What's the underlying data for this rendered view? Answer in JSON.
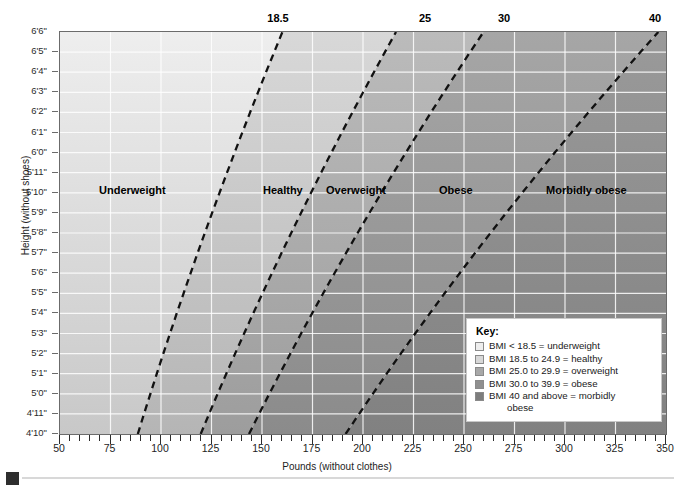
{
  "chart_data": {
    "type": "area",
    "title": "",
    "xlabel": "Pounds (without clothes)",
    "ylabel": "Height (without shoes)",
    "xlim": [
      50,
      350
    ],
    "ylim_inches": [
      58,
      78
    ],
    "xticks": [
      50,
      75,
      100,
      125,
      150,
      175,
      200,
      225,
      250,
      275,
      300,
      325,
      350
    ],
    "xtick_labels": [
      "50",
      "75",
      "100",
      "125",
      "150",
      "175",
      "200",
      "225",
      "250",
      "275",
      "300",
      "325",
      "350"
    ],
    "x_minor_tick_step": 5,
    "ytick_labels": [
      "6'6\"",
      "6'5\"",
      "6'4\"",
      "6'3\"",
      "6'2\"",
      "6'1\"",
      "6'0\"",
      "5'11\"",
      "5'10\"",
      "5'9\"",
      "5'8\"",
      "5'7\"",
      "5'6\"",
      "5'5\"",
      "5'4\"",
      "5'3\"",
      "5'2\"",
      "5'1\"",
      "5'0\"",
      "4'11\"",
      "4'10\""
    ],
    "ytick_inches": [
      78,
      77,
      76,
      75,
      74,
      73,
      72,
      71,
      70,
      69,
      68,
      67,
      66,
      65,
      64,
      63,
      62,
      61,
      60,
      59,
      58
    ],
    "grid": true,
    "boundaries": [
      {
        "bmi": 18.5,
        "label": "18.5",
        "label_x_px": 278
      },
      {
        "bmi": 25,
        "label": "25",
        "label_x_px": 425
      },
      {
        "bmi": 30,
        "label": "30",
        "label_x_px": 504
      },
      {
        "bmi": 40,
        "label": "40",
        "label_x_px": 655
      }
    ],
    "bands": [
      {
        "name": "Underweight",
        "bmi_min": 0,
        "bmi_max": 18.5,
        "color": "#eeeeee"
      },
      {
        "name": "Healthy",
        "bmi_min": 18.5,
        "bmi_max": 25,
        "color": "#d8d8d8"
      },
      {
        "name": "Overweight",
        "bmi_min": 25,
        "bmi_max": 30,
        "color": "#bbbbbb"
      },
      {
        "name": "Obese",
        "bmi_min": 30,
        "bmi_max": 40,
        "color": "#a6a6a6"
      },
      {
        "name": "Morbidly obese",
        "bmi_min": 40,
        "bmi_max": 999,
        "color": "#9a9a9a"
      }
    ],
    "region_labels": [
      {
        "text": "Underweight",
        "x_px": 98,
        "y_px": 183
      },
      {
        "text": "Healthy",
        "x_px": 262,
        "y_px": 183
      },
      {
        "text": "Overweight",
        "x_px": 325,
        "y_px": 183
      },
      {
        "text": "Obese",
        "x_px": 438,
        "y_px": 183
      },
      {
        "text": "Morbidly obese",
        "x_px": 545,
        "y_px": 183
      }
    ]
  },
  "axis": {
    "x_title": "Pounds (without clothes)",
    "y_title": "Height (without shoes)"
  },
  "key": {
    "title": "Key:",
    "items": [
      {
        "swatch": "#eeeeee",
        "text": "BMI < 18.5 = underweight",
        "cont": ""
      },
      {
        "swatch": "#d8d8d8",
        "text": "BMI 18.5 to 24.9 = healthy",
        "cont": ""
      },
      {
        "swatch": "#a8a8a8",
        "text": "BMI 25.0 to 29.9 = overweight",
        "cont": ""
      },
      {
        "swatch": "#8f8f8f",
        "text": "BMI 30.0 to 39.9 = obese",
        "cont": ""
      },
      {
        "swatch": "#7d7d7d",
        "text": "BMI 40 and above = morbidly",
        "cont": "obese"
      }
    ]
  }
}
